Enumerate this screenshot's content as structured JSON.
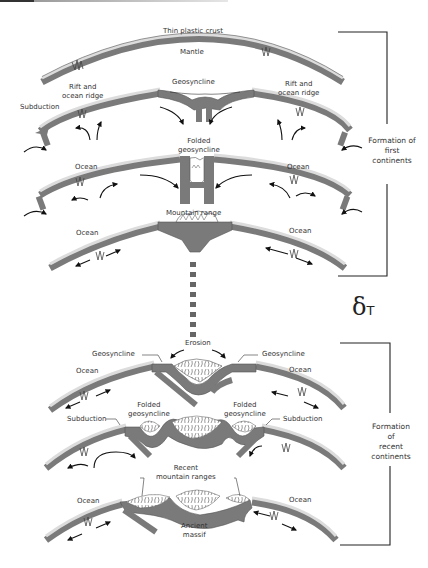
{
  "diagram": {
    "type": "geological-process",
    "colors": {
      "crust": "#dcdcdc",
      "plate": "#7a7a7a",
      "plate_dark": "#666666",
      "outline": "#555555",
      "arrow": "#111111",
      "bracket": "#222222",
      "text": "#333333"
    },
    "stages": [
      {
        "id": "stage-1",
        "labels": {
          "top": "Thin plastic crust",
          "middle": "Mantle"
        }
      },
      {
        "id": "stage-2",
        "labels": {
          "geosyncline": "Geosyncline",
          "rift_left": "Rift and ocean ridge",
          "rift_right": "Rift and ocean ridge",
          "subduction": "Subduction"
        }
      },
      {
        "id": "stage-3",
        "labels": {
          "center": "Folded geosyncline",
          "ocean_left": "Ocean",
          "ocean_right": "Ocean"
        }
      },
      {
        "id": "stage-4",
        "labels": {
          "center": "Mountain range",
          "ocean_left": "Ocean",
          "ocean_right": "Ocean"
        }
      },
      {
        "id": "stage-5",
        "labels": {
          "top": "Erosion",
          "geosyncline_left": "Geosyncline",
          "geosyncline_right": "Geosyncline",
          "ocean_left": "Ocean",
          "ocean_right": "Ocean"
        }
      },
      {
        "id": "stage-6",
        "labels": {
          "folded_left": "Folded geosyncline",
          "folded_right": "Folded geosyncline",
          "subduction_left": "Subduction",
          "subduction_right": "Subduction"
        }
      },
      {
        "id": "stage-7",
        "labels": {
          "top": "Recent mountain ranges",
          "bottom": "Ancient massif",
          "ocean_left": "Ocean",
          "ocean_right": "Ocean"
        }
      }
    ],
    "brackets": [
      {
        "id": "first",
        "label": "Formation of first continents"
      },
      {
        "id": "recent",
        "label": "Formation of recent continents"
      }
    ],
    "time_symbol": {
      "delta": "δ",
      "t": "T"
    }
  },
  "text": {
    "thin_crust": "Thin plastic crust",
    "mantle": "Mantle",
    "rift_l1": "Rift and",
    "rift_l2": "ocean ridge",
    "geosyncline": "Geosyncline",
    "subduction": "Subduction",
    "folded": "Folded",
    "geosyncline_lc": "geosyncline",
    "ocean": "Ocean",
    "mountain_range": "Mountain range",
    "erosion": "Erosion",
    "recent": "Recent",
    "recent_ranges": "mountain ranges",
    "ancient": "Ancient",
    "massif": "massif",
    "first_1": "Formation of",
    "first_2": "first",
    "first_3": "continents",
    "recent_1": "Formation",
    "recent_2": "of",
    "recent_3": "recent",
    "recent_4": "continents",
    "delta": "δ",
    "t": "T"
  }
}
